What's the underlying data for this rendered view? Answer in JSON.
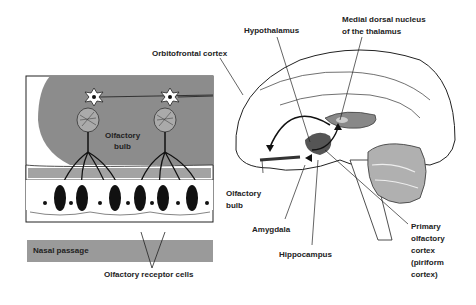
{
  "diagram": {
    "type": "anatomy-illustration",
    "panels": {
      "left": {
        "title": "Olfactory epithelium and bulb inset"
      },
      "right": {
        "title": "Sagittal brain section"
      }
    },
    "labels": {
      "orbitofrontal_cortex": "Orbitofrontal cortex",
      "hypothalamus": "Hypothalamus",
      "medial_dorsal_1": "Medial dorsal nucleus",
      "medial_dorsal_2": "of the thalamus",
      "olfactory_bulb_inset_1": "Olfactory",
      "olfactory_bulb_inset_2": "bulb",
      "olfactory_bulb_1": "Olfactory",
      "olfactory_bulb_2": "bulb",
      "amygdala": "Amygdala",
      "hippocampus": "Hippocampus",
      "primary_1": "Primary",
      "primary_2": "olfactory",
      "primary_3": "cortex",
      "primary_4": "(piriform",
      "primary_5": "cortex)",
      "nasal_passage": "Nasal passage",
      "receptor_cells": "Olfactory receptor cells"
    },
    "colors": {
      "bulb_gray": "#8c8c8c",
      "nasal_gray": "#9a9a9a",
      "outline": "#1a1a1a",
      "dark_region": "#555555",
      "cerebellum": "#b0b0b0"
    }
  }
}
